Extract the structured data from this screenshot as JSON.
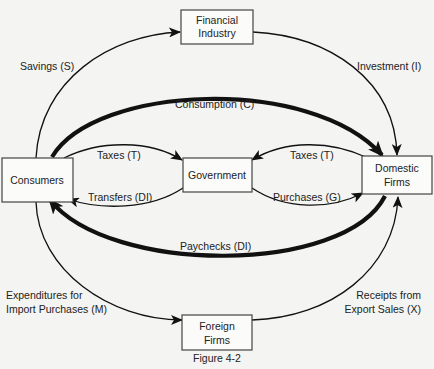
{
  "diagram": {
    "type": "circular-flow",
    "caption": "Figure 4-2",
    "nodes": {
      "financial_industry": [
        "Financial",
        "Industry"
      ],
      "consumers": [
        "Consumers"
      ],
      "government": [
        "Government"
      ],
      "domestic_firms": [
        "Domestic",
        "Firms"
      ],
      "foreign_firms": [
        "Foreign",
        "Firms"
      ]
    },
    "flows": {
      "savings": {
        "label": "Savings (S)",
        "from": "Consumers",
        "to": "Financial Industry"
      },
      "investment": {
        "label": "Investment (I)",
        "from": "Financial Industry",
        "to": "Domestic Firms"
      },
      "consumption": {
        "label": "Consumption (C)",
        "from": "Consumers",
        "to": "Domestic Firms",
        "emphasis": "thick"
      },
      "taxes_consumers": {
        "label": "Taxes (T)",
        "from": "Consumers",
        "to": "Government"
      },
      "transfers": {
        "label": "Transfers (DI)",
        "from": "Government",
        "to": "Consumers"
      },
      "taxes_firms": {
        "label": "Taxes (T)",
        "from": "Domestic Firms",
        "to": "Government"
      },
      "purchases": {
        "label": "Purchases (G)",
        "from": "Government",
        "to": "Domestic Firms"
      },
      "paychecks": {
        "label": "Paychecks (DI)",
        "from": "Domestic Firms",
        "to": "Consumers",
        "emphasis": "thick"
      },
      "imports": {
        "label": [
          "Expenditures for",
          "Import Purchases (M)"
        ],
        "from": "Consumers",
        "to": "Foreign Firms"
      },
      "exports": {
        "label": [
          "Receipts from",
          "Export Sales (X)"
        ],
        "from": "Foreign Firms",
        "to": "Domestic Firms"
      }
    }
  }
}
